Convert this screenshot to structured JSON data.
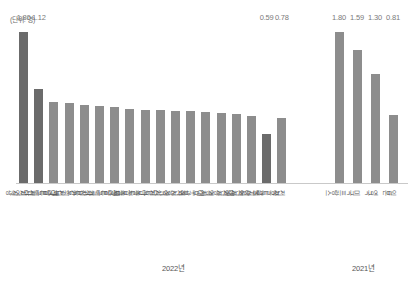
{
  "unit_note": "(단위: 명)",
  "chart_data": {
    "type": "bar",
    "title": "",
    "xlabel": "",
    "ylabel": "",
    "unit": "명",
    "ylim": [
      0,
      1.9
    ],
    "grid": false,
    "legend": "none",
    "groups": [
      {
        "name": "2022년",
        "label": "2022년",
        "categories": [
          "전남 영광",
          "세종특별자치시",
          "전라남도",
          "강원도",
          "경상북도",
          "제주특별자치도",
          "충청남도",
          "충청북도",
          "전라북도",
          "경상남도",
          "울산광역시",
          "대구광역시",
          "경기도",
          "대전광역시",
          "인천광역시",
          "광주광역시",
          "서울특별시",
          "전국"
        ],
        "values": [
          1.8,
          1.12,
          0.97,
          0.96,
          0.93,
          0.92,
          0.91,
          0.88,
          0.87,
          0.87,
          0.86,
          0.86,
          0.85,
          0.84,
          0.82,
          0.8,
          0.59,
          0.78
        ],
        "labeled_values": {
          "0": "1.80",
          "1": "1.12",
          "16": "0.59",
          "17": "0.78"
        },
        "highlighted": [
          0,
          1,
          16
        ]
      },
      {
        "name": "2021년",
        "label": "2021년",
        "categories": [
          "프랑스",
          "미국",
          "영국",
          "일본"
        ],
        "values": [
          1.8,
          1.59,
          1.3,
          0.81
        ],
        "labeled_values": {
          "0": "1.80",
          "1": "1.59",
          "2": "1.30",
          "3": "0.81"
        },
        "highlighted": []
      }
    ],
    "colors": {
      "bar": "#8d8d8d",
      "bar_highlight": "#6b6b6b",
      "value_text": "#7a7a7a",
      "axis": "#c9c9c9",
      "category_text": "#555555"
    }
  }
}
